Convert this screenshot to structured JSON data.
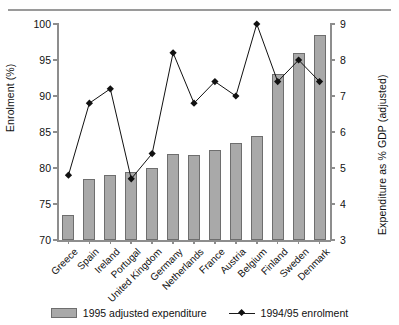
{
  "chart_data": {
    "type": "bar",
    "title": "",
    "subtitle": "",
    "xlabel": "",
    "ylabel": "Enrolment (%)",
    "y2label": "Expenditure as % GDP (adjusted)",
    "ylim": [
      70,
      100
    ],
    "y2lim": [
      3,
      9
    ],
    "yticks": [
      70,
      75,
      80,
      85,
      90,
      95,
      100
    ],
    "y2ticks": [
      3,
      4,
      5,
      6,
      7,
      8,
      9
    ],
    "grid": false,
    "legend_position": "bottom",
    "categories": [
      "Greece",
      "Spain",
      "Ireland",
      "Portugal",
      "United Kingdom",
      "Germany",
      "Netherlands",
      "France",
      "Austria",
      "Belgium",
      "Finland",
      "Sweden",
      "Denmark"
    ],
    "series": [
      {
        "name": "1995 adjusted expenditure",
        "type": "bar",
        "axis": "right",
        "color": "#a9a9a9",
        "edge_color": "#6e6e6e",
        "values": [
          3.7,
          4.7,
          4.8,
          4.9,
          5.0,
          5.4,
          5.35,
          5.5,
          5.7,
          5.9,
          7.6,
          8.2,
          8.7
        ]
      },
      {
        "name": "1994/95 enrolment",
        "type": "line",
        "axis": "left",
        "color": "#111111",
        "marker": "diamond",
        "values": [
          79,
          89,
          91,
          78.5,
          82,
          96,
          89,
          92,
          90,
          100,
          92,
          95,
          92
        ]
      }
    ]
  },
  "legend": {
    "items": [
      {
        "label": "1995 adjusted expenditure",
        "icon": "bar-swatch"
      },
      {
        "label": "1994/95 enrolment",
        "icon": "line-diamond-marker"
      }
    ]
  }
}
